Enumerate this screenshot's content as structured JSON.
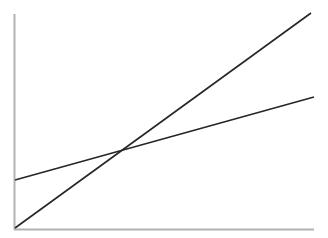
{
  "figure": {
    "width": 328,
    "height": 238,
    "background_color": "#ffffff",
    "title": "",
    "subtitle": "",
    "caption": ""
  },
  "style": {
    "axis_color": "#b2b2b2",
    "axis_width": 2,
    "line_color": "#262626",
    "line_width": 1.6
  },
  "axes": {
    "y_axis": {
      "name": "y-axis",
      "x": 14.5,
      "y_top": 14,
      "y_bottom": 230,
      "label": "",
      "ticks": []
    },
    "x_axis": {
      "name": "x-axis",
      "y": 229.5,
      "x_left": 14,
      "x_right": 314,
      "label": "",
      "ticks": []
    }
  },
  "chart_data": {
    "type": "line",
    "title": "",
    "xlabel": "",
    "ylabel": "",
    "xlim": [
      0,
      1
    ],
    "ylim": [
      0,
      1
    ],
    "grid": false,
    "legend": "none",
    "tick_labels": {
      "x": [],
      "y": []
    },
    "annotations": [],
    "series": [
      {
        "name": "steep-line",
        "description": "steep rising line from origin to top right",
        "pixel_points": [
          [
            15,
            228
          ],
          [
            311,
            13
          ]
        ],
        "x": [
          0.0,
          1.0
        ],
        "values": [
          0.0,
          1.0
        ],
        "color": "#262626",
        "width": 1.6
      },
      {
        "name": "shallow-line",
        "description": "shallow rising line from left axis to right edge",
        "pixel_points": [
          [
            15,
            180
          ],
          [
            314,
            97
          ]
        ],
        "x": [
          0.0,
          1.0
        ],
        "values": [
          0.22,
          0.61
        ],
        "color": "#262626",
        "width": 1.6
      }
    ],
    "intersection": {
      "pixel_point": [
        124,
        149
      ],
      "x": 0.365,
      "y": 0.37
    }
  }
}
